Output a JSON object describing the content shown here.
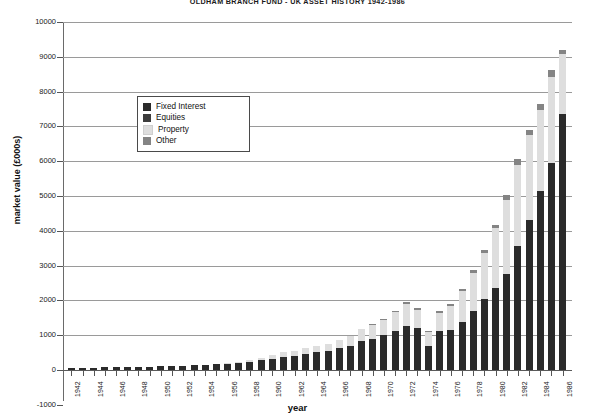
{
  "chart_data": {
    "type": "bar",
    "stacked": true,
    "title": "OLDHAM BRANCH FUND  -  UK ASSET HISTORY 1942-1986",
    "xlabel": "year",
    "ylabel": "market value (£000s)",
    "ylim": [
      -1000,
      10000
    ],
    "ytick_step": 1000,
    "yticks": [
      -1000,
      0,
      1000,
      2000,
      3000,
      4000,
      5000,
      6000,
      7000,
      8000,
      9000,
      10000
    ],
    "ytick_labels": [
      "-1000",
      "0",
      "1000",
      "2000",
      "3000",
      "4000",
      "5000",
      "6000",
      "7000",
      "8000",
      "9000",
      "10000"
    ],
    "grid": true,
    "legend_position": "inside-upper-left",
    "xlim": [
      1942,
      1986
    ],
    "xtick_step": 2,
    "categories": [
      1942,
      1943,
      1944,
      1945,
      1946,
      1947,
      1948,
      1949,
      1950,
      1951,
      1952,
      1953,
      1954,
      1955,
      1956,
      1957,
      1958,
      1959,
      1960,
      1961,
      1962,
      1963,
      1964,
      1965,
      1966,
      1967,
      1968,
      1969,
      1970,
      1971,
      1972,
      1973,
      1974,
      1975,
      1976,
      1977,
      1978,
      1979,
      1980,
      1981,
      1982,
      1983,
      1984,
      1985,
      1986
    ],
    "xtick_labels": [
      "1942",
      "1944",
      "1946",
      "1948",
      "1950",
      "1952",
      "1954",
      "1956",
      "1958",
      "1960",
      "1962",
      "1964",
      "1966",
      "1968",
      "1970",
      "1972",
      "1974",
      "1976",
      "1978",
      "1980",
      "1982",
      "1984",
      "1986"
    ],
    "series": [
      {
        "name": "Fixed Interest",
        "color": "#2b2b2b",
        "values": [
          60,
          65,
          70,
          78,
          85,
          90,
          95,
          100,
          108,
          115,
          125,
          135,
          150,
          165,
          185,
          210,
          240,
          275,
          320,
          360,
          400,
          450,
          510,
          560,
          620,
          700,
          820,
          900,
          1000,
          1130,
          1260,
          1200,
          690,
          1120,
          1150,
          1380,
          1700,
          2050,
          2350,
          2750,
          3550,
          4300,
          5150,
          5950,
          7350
        ]
      },
      {
        "name": "Equities",
        "color": "#3d3d3d",
        "values": [
          0,
          0,
          0,
          0,
          0,
          0,
          0,
          0,
          0,
          0,
          0,
          0,
          0,
          0,
          0,
          0,
          0,
          0,
          0,
          0,
          0,
          0,
          0,
          0,
          0,
          0,
          0,
          0,
          0,
          0,
          0,
          0,
          0,
          0,
          0,
          0,
          0,
          0,
          0,
          0,
          0,
          0,
          0,
          0,
          0
        ]
      },
      {
        "name": "Property",
        "color": "#dedede",
        "values": [
          0,
          0,
          0,
          0,
          0,
          0,
          0,
          0,
          0,
          0,
          0,
          0,
          0,
          0,
          15,
          25,
          45,
          75,
          120,
          150,
          160,
          170,
          185,
          200,
          230,
          290,
          360,
          400,
          440,
          530,
          640,
          520,
          400,
          520,
          700,
          880,
          1080,
          1300,
          1720,
          2150,
          2350,
          2450,
          2330,
          2480,
          1740
        ]
      },
      {
        "name": "Other",
        "color": "#848484",
        "values": [
          0,
          0,
          0,
          0,
          0,
          0,
          0,
          0,
          0,
          0,
          0,
          0,
          0,
          0,
          0,
          0,
          0,
          0,
          0,
          0,
          0,
          0,
          0,
          0,
          0,
          0,
          0,
          30,
          40,
          50,
          60,
          50,
          40,
          50,
          60,
          70,
          80,
          90,
          110,
          130,
          150,
          160,
          170,
          180,
          110
        ]
      }
    ],
    "totals": [
      60,
      65,
      70,
      78,
      85,
      90,
      95,
      100,
      108,
      115,
      125,
      135,
      150,
      165,
      200,
      235,
      285,
      350,
      440,
      510,
      560,
      620,
      695,
      760,
      850,
      990,
      1180,
      1330,
      1480,
      1710,
      1960,
      1770,
      1130,
      1690,
      1910,
      2330,
      2860,
      3440,
      4180,
      5030,
      6050,
      6910,
      7650,
      8610,
      9200
    ]
  },
  "legend": {
    "items": [
      {
        "label": "Fixed Interest",
        "color": "#2b2b2b"
      },
      {
        "label": "Equities",
        "color": "#3d3d3d"
      },
      {
        "label": "Property",
        "color": "#dedede"
      },
      {
        "label": "Other",
        "color": "#848484"
      }
    ]
  }
}
